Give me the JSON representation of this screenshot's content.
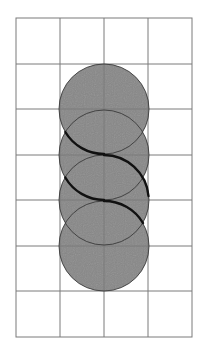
{
  "figure": {
    "grid": {
      "columns": 4,
      "rows": 7,
      "x0": 16,
      "y0": 18,
      "x1": 192,
      "y1": 337,
      "line_color": "#7a7a7a"
    },
    "circles": [
      {
        "cx": 104,
        "cy": 109,
        "r": 45
      },
      {
        "cx": 104,
        "cy": 155,
        "r": 45
      },
      {
        "cx": 104,
        "cy": 200,
        "r": 45
      },
      {
        "cx": 104,
        "cy": 246,
        "r": 45
      }
    ],
    "colors": {
      "circle_fill": "#878787",
      "circle_stroke": "#3a3a3a",
      "curve_stroke": "#111111",
      "background": "#ffffff"
    }
  }
}
